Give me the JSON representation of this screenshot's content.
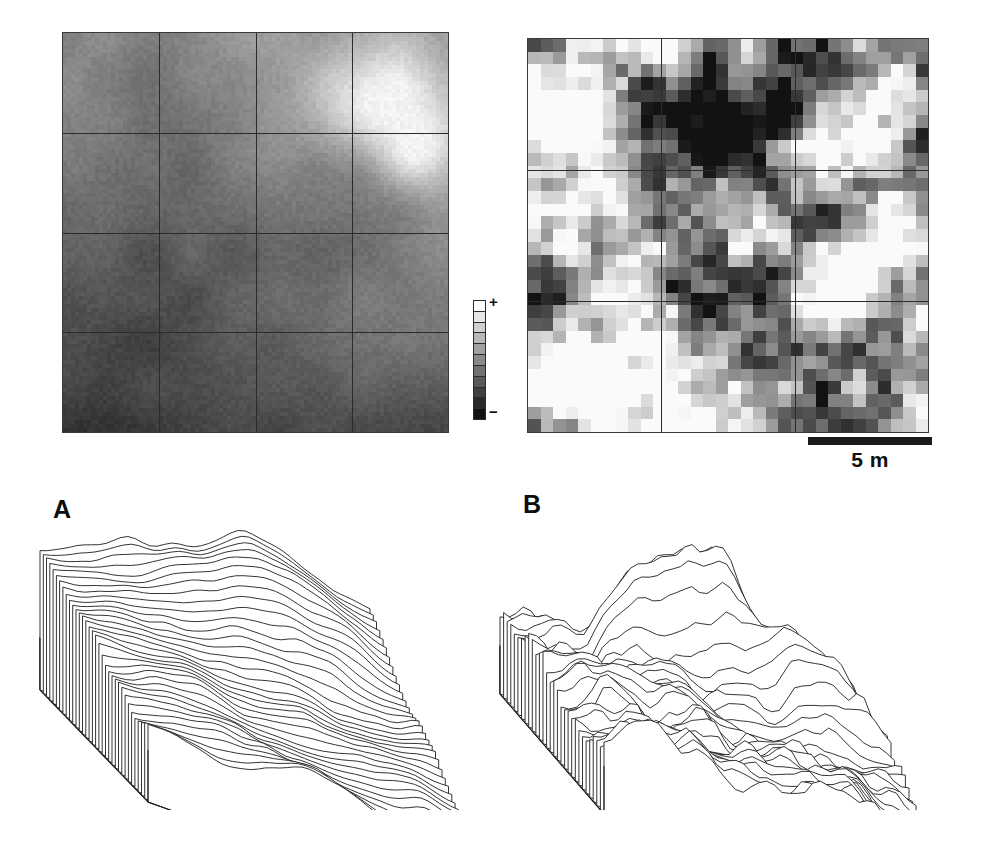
{
  "figure": {
    "background": "#ffffff",
    "width": 985,
    "height": 866
  },
  "maps": [
    {
      "id": "map-trend",
      "name": "trend-surface-map",
      "position": {
        "left": 62,
        "top": 32,
        "width": 387,
        "height": 401
      },
      "grid": {
        "columns": 4,
        "rows": 4,
        "line_color": "#2b2b2b"
      },
      "description": "Smooth gradient raster, bright in the upper right, dark toward the lower left",
      "bright_corner": "upper-right",
      "dark_corner": "lower-left",
      "pattern": "smooth-gradient",
      "contrast": 0.45,
      "seed": 17
    },
    {
      "id": "map-residual",
      "name": "residual-map",
      "position": {
        "left": 527,
        "top": 38,
        "width": 402,
        "height": 395
      },
      "grid": {
        "columns": 3,
        "rows": 3,
        "line_color": "#2b2b2b"
      },
      "description": "High contrast blocky residual raster with a dark mass upper-centre and bright patches right and lower-left",
      "bright_corner": "right",
      "dark_corner": "upper-centre",
      "pattern": "blocky-noise",
      "contrast": 1.0,
      "seed": 92
    }
  ],
  "colorbar": {
    "name": "grayscale-legend",
    "segments": 11,
    "top_color": "#ffffff",
    "bottom_color": "#121212",
    "high_label": "+",
    "low_label": "−",
    "orientation": "vertical"
  },
  "scalebar": {
    "name": "scale-bar",
    "label": "5 m",
    "length_px": 124,
    "color": "#1a1a1a"
  },
  "panels": [
    {
      "id": "panel-a",
      "letter": "A",
      "name": "surface-plot-trend",
      "description": "Wireframe mesh of the smooth trend surface: a broad ridge rising toward the back with a flat plain in front",
      "roughness": 0.18,
      "profiles": 34,
      "peaks": 1
    },
    {
      "id": "panel-b",
      "letter": "B",
      "name": "surface-plot-residual",
      "description": "Wireframe mesh of the residual surface: many sharp irregular peaks across the whole plot",
      "roughness": 0.95,
      "profiles": 30,
      "peaks": 6
    }
  ],
  "chart_data": {
    "type": "heatmap",
    "xlabel": "",
    "ylabel": "",
    "legend": {
      "position": "between-maps",
      "high": "+",
      "low": "−"
    },
    "annotations": [
      "A",
      "B",
      "5 m",
      "+",
      "−"
    ],
    "panels": [
      {
        "name": "trend-surface-map",
        "kind": "raster",
        "grid_cells": "4 x 4",
        "value_range": [
          "-",
          "+"
        ],
        "spatial_trend": "increases from lower-left (low) to upper-right (high)"
      },
      {
        "name": "residual-map",
        "kind": "raster",
        "grid_cells": "3 x 3",
        "value_range": [
          "-",
          "+"
        ],
        "spatial_trend": "no systematic trend; short-range blocky variation"
      },
      {
        "name": "surface-plot-trend",
        "kind": "wireframe-surface",
        "label": "A",
        "relief": "single broad ridge, smooth"
      },
      {
        "name": "surface-plot-residual",
        "kind": "wireframe-surface",
        "label": "B",
        "relief": "multiple sharp peaks, rough"
      }
    ],
    "scale": {
      "bar_label": "5 m"
    }
  }
}
